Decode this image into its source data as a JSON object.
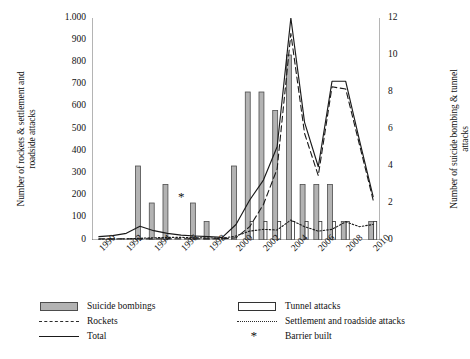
{
  "chart_data": {
    "type": "bar",
    "title": "",
    "xlabel": "",
    "ylabel": "Number of rockets & settlement and roadside attacks",
    "y2label": "Number of suicide bombing & tunnel attacks",
    "ylim": [
      0,
      1000
    ],
    "y2lim": [
      0,
      12
    ],
    "grid": false,
    "legend_position": "bottom",
    "x": [
      1990,
      1991,
      1992,
      1993,
      1994,
      1995,
      1996,
      1997,
      1998,
      1999,
      2000,
      2001,
      2002,
      2003,
      2004,
      2005,
      2006,
      2007,
      2008,
      2009,
      2010
    ],
    "xtick_labels": [
      "1990",
      "1992",
      "1994",
      "1996",
      "1998",
      "2000",
      "2002",
      "2004",
      "2006",
      "2008",
      "2010"
    ],
    "ytick_labels": [
      "0",
      "100",
      "200",
      "300",
      "400",
      "500",
      "600",
      "700",
      "800",
      "900",
      "1.000"
    ],
    "y2tick_labels": [
      "0",
      "2",
      "4",
      "6",
      "8",
      "10",
      "12"
    ],
    "series": [
      {
        "name": "Suicide bombings",
        "type": "bar",
        "axis": "right",
        "style": "filled-gray",
        "values": [
          0,
          0,
          0,
          4,
          2,
          3,
          0,
          2,
          1,
          0,
          4,
          8,
          8,
          7,
          10,
          3,
          3,
          3,
          1,
          0,
          1
        ]
      },
      {
        "name": "Tunnel attacks",
        "type": "bar",
        "axis": "right",
        "style": "hollow-white",
        "values": [
          0,
          0,
          0,
          0,
          0,
          0,
          0,
          0,
          0,
          0,
          0,
          1,
          1,
          1,
          1,
          1,
          1,
          1,
          1,
          0,
          1
        ]
      },
      {
        "name": "Rockets",
        "type": "line",
        "axis": "left",
        "style": "dashed",
        "values": [
          5,
          5,
          5,
          5,
          5,
          5,
          5,
          5,
          5,
          5,
          10,
          60,
          160,
          320,
          930,
          480,
          290,
          690,
          680,
          430,
          180
        ]
      },
      {
        "name": "Total",
        "type": "line",
        "axis": "left",
        "style": "solid",
        "values": [
          15,
          20,
          30,
          62,
          42,
          30,
          22,
          18,
          15,
          12,
          70,
          180,
          270,
          420,
          1000,
          530,
          330,
          715,
          715,
          450,
          195
        ]
      },
      {
        "name": "Settlement and roadside attacks",
        "type": "line",
        "axis": "left",
        "style": "dotted",
        "values": [
          3,
          4,
          5,
          8,
          10,
          12,
          12,
          10,
          9,
          8,
          18,
          40,
          48,
          45,
          90,
          60,
          40,
          48,
          82,
          60,
          70
        ]
      }
    ],
    "annotations": [
      {
        "name": "Barrier built",
        "marker": "*",
        "x": 1996,
        "y": 175
      }
    ]
  },
  "legend": {
    "items": [
      {
        "label": "Suicide bombings",
        "key": "filled-bar-key"
      },
      {
        "label": "Rockets",
        "key": "dashed-line-key"
      },
      {
        "label": "Total",
        "key": "solid-line-key"
      },
      {
        "label": "Tunnel attacks",
        "key": "hollow-bar-key"
      },
      {
        "label": "Settlement and roadside attacks",
        "key": "dotted-line-key"
      },
      {
        "label": "Barrier built",
        "key": "asterisk-key"
      }
    ]
  },
  "colors": {
    "bar_fill": "#b3b3b3",
    "bar_stroke": "#4d4d4d",
    "hollow_fill": "#ffffff",
    "hollow_stroke": "#333333",
    "line": "#1a1a1a",
    "axis": "#595959"
  }
}
